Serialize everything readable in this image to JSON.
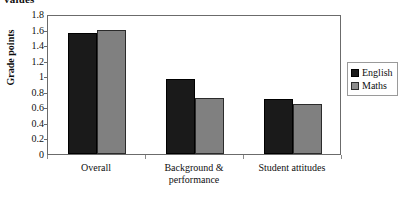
{
  "clipped_title": "values",
  "chart_data": {
    "type": "bar",
    "title": "",
    "xlabel": "",
    "ylabel": "Grade points",
    "ylim": [
      0,
      1.8
    ],
    "ytick_step": 0.2,
    "yticks": [
      "1.8",
      "1.6",
      "1.4",
      "1.2",
      "1",
      "0.8",
      "0.6",
      "0.4",
      "0.2",
      "0"
    ],
    "ytick_values": [
      1.8,
      1.6,
      1.4,
      1.2,
      1.0,
      0.8,
      0.6,
      0.4,
      0.2,
      0
    ],
    "grid": false,
    "legend_position": "right",
    "categories": [
      "Overall",
      "Background &\nperformance",
      "Student attitudes"
    ],
    "series": [
      {
        "name": "English",
        "color": "#1a1a1a",
        "values": [
          1.55,
          0.97,
          0.71
        ]
      },
      {
        "name": "Maths",
        "color": "#808080",
        "values": [
          1.6,
          0.72,
          0.64
        ]
      }
    ]
  }
}
